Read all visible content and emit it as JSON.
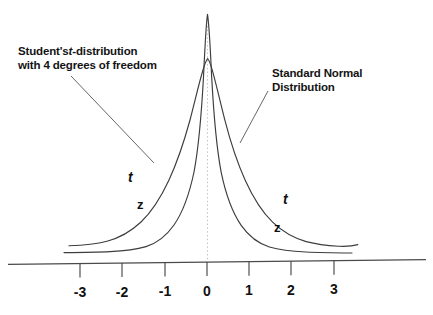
{
  "chart_data": {
    "type": "line",
    "title": "",
    "xlabel": "",
    "ylabel": "",
    "xlim": [
      -3.55,
      3.6
    ],
    "ylim": [
      0,
      0.44
    ],
    "grid": false,
    "legend_position": "inline-annotations",
    "x_ticks": [
      -3,
      -2,
      -1,
      0,
      1,
      2,
      3
    ],
    "x_tick_labels": [
      "-3",
      "-2",
      "-1",
      "0",
      "1",
      "2",
      "3"
    ],
    "series": [
      {
        "name": "Standard Normal Distribution",
        "short_label": "z",
        "peak_value": 0.399,
        "peak_x": 0,
        "x": [
          -3.4,
          -3.0,
          -2.6,
          -2.2,
          -1.8,
          -1.4,
          -1.0,
          -0.6,
          -0.2,
          0.0,
          0.2,
          0.6,
          1.0,
          1.4,
          1.8,
          2.2,
          2.6,
          3.0,
          3.4
        ],
        "values": [
          0.001,
          0.004,
          0.014,
          0.035,
          0.079,
          0.15,
          0.242,
          0.333,
          0.391,
          0.399,
          0.391,
          0.333,
          0.242,
          0.15,
          0.079,
          0.035,
          0.014,
          0.004,
          0.001
        ]
      },
      {
        "name": "Student's t-distribution with 4 degrees of freedom",
        "short_label": "t",
        "degrees_of_freedom": 4,
        "peak_value": 0.375,
        "peak_x": 0,
        "x": [
          -3.4,
          -3.0,
          -2.6,
          -2.2,
          -1.8,
          -1.4,
          -1.0,
          -0.6,
          -0.2,
          0.0,
          0.2,
          0.6,
          1.0,
          1.4,
          1.8,
          2.2,
          2.6,
          3.0,
          3.4
        ],
        "values": [
          0.011,
          0.02,
          0.033,
          0.054,
          0.086,
          0.131,
          0.187,
          0.271,
          0.357,
          0.375,
          0.357,
          0.271,
          0.187,
          0.131,
          0.086,
          0.054,
          0.033,
          0.02,
          0.011
        ]
      }
    ],
    "annotations": {
      "left_callout_line1": "Student's",
      "left_callout_italic": "t",
      "left_callout_line1_rest": "-distribution",
      "left_callout_line2": "with 4 degrees of freedom",
      "right_callout_line1": "Standard Normal",
      "right_callout_line2": "Distribution",
      "curve_label_t_left": "t",
      "curve_label_z_left": "z",
      "curve_label_t_right": "t",
      "curve_label_z_right": "z"
    },
    "colors": {
      "ink": "#111111",
      "curve": "#3a3a3a",
      "axis": "#444444",
      "center_line": "#b8b8b8",
      "background": "#ffffff"
    }
  }
}
